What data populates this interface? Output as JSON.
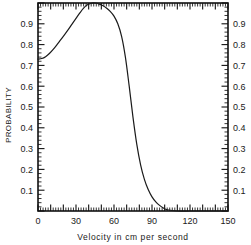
{
  "chart_data": {
    "type": "line",
    "title": "",
    "xlabel": "Velocity in  cm   per  second",
    "ylabel": "PROBABILITY",
    "xlim": [
      0,
      150
    ],
    "ylim": [
      0,
      1.0
    ],
    "grid": false,
    "legend": null,
    "x_tick_labels": [
      "0",
      "30",
      "60",
      "90",
      "120",
      "150"
    ],
    "x_tick_values": [
      0,
      30,
      60,
      90,
      120,
      150
    ],
    "y_tick_labels": [
      "0.1",
      "0.2",
      "0.3",
      "0.4",
      "0.5",
      "0.6",
      "0.7",
      "0.8",
      "0.9"
    ],
    "y_tick_values": [
      0.1,
      0.2,
      0.3,
      0.4,
      0.5,
      0.6,
      0.7,
      0.8,
      0.9
    ],
    "y_tick_labels_right": [
      "0.1",
      "0.2",
      "0.3",
      "0.4",
      "0.5",
      "0.6",
      "0.7",
      "0.8",
      "0.9"
    ],
    "x_minor_tick_step": 2,
    "x_major_tick_step": 10,
    "y_minor_tick_step": 0.02,
    "y_major_tick_step": 0.1,
    "series": [
      {
        "name": "probability",
        "x": [
          0,
          3,
          6,
          9,
          12,
          15,
          18,
          21,
          24,
          27,
          30,
          33,
          36,
          39,
          42,
          45,
          48,
          51,
          54,
          57,
          60,
          63,
          66,
          69,
          72,
          75,
          78,
          81,
          84,
          87,
          90,
          93,
          96,
          99,
          102,
          110,
          120,
          130,
          140,
          150
        ],
        "y": [
          0.73,
          0.733,
          0.742,
          0.757,
          0.777,
          0.8,
          0.824,
          0.848,
          0.873,
          0.9,
          0.926,
          0.952,
          0.975,
          0.991,
          0.999,
          1.0,
          0.996,
          0.988,
          0.976,
          0.96,
          0.937,
          0.9,
          0.84,
          0.74,
          0.6,
          0.45,
          0.32,
          0.222,
          0.152,
          0.103,
          0.068,
          0.044,
          0.027,
          0.014,
          0.006,
          0.0,
          0.0,
          0.0,
          0.0,
          0.0
        ]
      }
    ]
  },
  "plot_geometry": {
    "left_px": 38,
    "right_px": 228,
    "top_px": 3,
    "bottom_px": 211
  },
  "colors": {
    "axis": "#111111",
    "curve": "#1a1a1a",
    "background": "#ffffff",
    "text": "#1a1a1a"
  }
}
